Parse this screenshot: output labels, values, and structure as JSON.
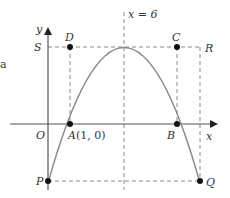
{
  "figure": {
    "axis_labels": {
      "x": "x",
      "y": "y",
      "origin": "O"
    },
    "symmetry_line": {
      "label": "x = 6",
      "x_value": 6
    },
    "level_label": "S",
    "stray_text": "a",
    "points": [
      {
        "name": "D",
        "label": "D"
      },
      {
        "name": "C",
        "label": "C"
      },
      {
        "name": "R",
        "label": "R"
      },
      {
        "name": "A",
        "label": "A",
        "coords": "(1, 0)"
      },
      {
        "name": "B",
        "label": "B"
      },
      {
        "name": "P",
        "label": "P"
      },
      {
        "name": "Q",
        "label": "Q"
      }
    ],
    "colors": {
      "curve": "#8a8a8a",
      "axis": "#555555",
      "dash": "#8a8a8a",
      "dot": "#111111",
      "text": "#333333"
    }
  }
}
